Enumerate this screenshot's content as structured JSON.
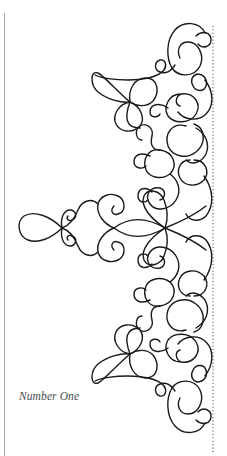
{
  "figure": {
    "caption": "Number One",
    "stroke_color": "#1a1a1a",
    "stroke_width": 1.4,
    "guide_color": "#333333",
    "page_edge_color": "#a8a8a8",
    "guide_line": {
      "x": 213,
      "y1": 26,
      "y2": 452,
      "dash": "1 2.4"
    },
    "motifs": [
      {
        "name": "top-right-scroll",
        "d": "M205 33 C200 22 184 20 175 30 C166 40 166 58 172 68 C178 77 194 78 200 66 C205 55 198 42 188 42 C180 42 176 50 180 58"
      },
      {
        "name": "top-small-curl",
        "d": "M196 36 C202 30 211 32 211 40 C211 46 203 50 198 44"
      },
      {
        "name": "top-connector",
        "d": "M175 65 C170 72 166 74 160 72 C154 70 154 62 160 60 C166 59 167 66 164 70 C158 78 140 80 128 80 C115 80 100 78 95 75"
      },
      {
        "name": "top-teardrop-left",
        "d": "M130 102 C118 92 104 76 98 73 C90 70 90 85 98 92 C108 100 122 103 130 102"
      },
      {
        "name": "top-clover-right-loop",
        "d": "M130 102 C128 90 134 78 146 78 C158 78 160 92 153 101 C146 108 136 106 130 102"
      },
      {
        "name": "top-clover-lower-loop",
        "d": "M130 102 C118 104 112 116 116 124 C120 132 132 134 140 126 C146 118 140 106 130 102 M130 102 C124 118 126 128 140 128"
      },
      {
        "name": "top-right-circle-1",
        "d": "M197 74 C204 74 208 80 206 86 C204 92 196 92 193 86 C190 80 192 76 197 74"
      },
      {
        "name": "top-right-circle-2",
        "d": "M181 94 C168 94 163 108 168 116 C174 124 190 124 196 114 C202 104 194 92 181 94 C176 96 174 104 180 106"
      },
      {
        "name": "top-right-curl",
        "d": "M168 108 C160 102 150 104 150 112 C150 118 158 118 160 114"
      },
      {
        "name": "top-right-tail",
        "d": "M205 80 C214 92 214 106 206 114 C198 122 184 120 178 112"
      },
      {
        "name": "upper-mid-scroll",
        "d": "M186 126 C172 122 164 134 168 146 C172 156 186 160 196 152 C206 144 206 128 194 124"
      },
      {
        "name": "upper-mid-curl",
        "d": "M196 128 C206 134 210 144 206 154 C202 162 192 166 186 160"
      },
      {
        "name": "upper-mid-circle-a",
        "d": "M160 150 C148 148 142 160 146 170 C150 178 162 180 170 174 C178 166 174 152 160 150"
      },
      {
        "name": "upper-mid-circle-b",
        "d": "M190 160 C180 160 176 170 180 178 C184 186 196 188 204 180 C210 172 206 160 194 160"
      },
      {
        "name": "upper-stem",
        "d": "M160 150 C152 150 150 144 152 136 C154 128 146 122 140 126 C134 130 136 140 142 140"
      },
      {
        "name": "upper-left-curl",
        "d": "M150 156 C142 152 134 154 134 162 C134 168 142 170 146 166"
      },
      {
        "name": "upper-swirl-to-center",
        "d": "M170 174 C178 180 182 190 176 200 C170 210 156 212 150 204 C144 196 150 186 160 188 C166 190 166 198 160 200"
      },
      {
        "name": "upper-right-scroll",
        "d": "M204 176 C214 190 214 206 206 216 C200 222 190 222 186 214"
      },
      {
        "name": "upper-curl-small",
        "d": "M152 192 C146 186 138 188 138 196 C138 202 144 204 148 200"
      },
      {
        "name": "center-knot-upper-petal",
        "d": "M165 228 C150 218 140 206 144 196 C148 188 160 190 164 200 C168 210 168 220 165 228"
      },
      {
        "name": "center-right-arc-up",
        "d": "M165 228 C180 222 196 214 206 206"
      },
      {
        "name": "center-right-arc-down",
        "d": "M165 228 C180 234 196 242 206 250"
      },
      {
        "name": "center-knot-lower-petal",
        "d": "M165 228 C150 238 140 250 144 260 C148 268 160 266 164 256 C168 246 168 236 165 228"
      },
      {
        "name": "center-stem",
        "d": "M165 228 C148 218 130 216 114 228 C130 240 148 238 165 228"
      },
      {
        "name": "center-heart-upper",
        "d": "M114 228 C104 224 96 214 98 204 C100 196 110 192 118 196 C126 200 126 212 118 214 C112 216 110 210 114 206"
      },
      {
        "name": "center-heart-lower",
        "d": "M114 228 C104 232 96 242 98 252 C100 260 110 264 118 260 C126 256 126 244 118 242 C112 240 110 246 114 250"
      },
      {
        "name": "center-s-upper",
        "d": "M98 204 C92 198 82 200 78 210 C74 220 68 226 62 228"
      },
      {
        "name": "center-s-lower",
        "d": "M98 252 C92 258 82 256 78 246 C74 236 68 230 62 228"
      },
      {
        "name": "center-small-loop-upper",
        "d": "M62 228 C60 218 64 210 70 210 C76 210 78 218 72 220 C68 222 66 218 68 216"
      },
      {
        "name": "center-small-loop-lower",
        "d": "M62 228 C60 238 64 246 70 246 C76 246 78 238 72 236 C68 234 66 238 68 240"
      },
      {
        "name": "center-left-teardrop",
        "d": "M62 228 C50 216 34 210 24 216 C16 222 18 236 28 240 C38 244 52 238 62 228"
      },
      {
        "name": "lower-swirl-from-center",
        "d": "M170 282 C178 276 182 266 176 256 C170 246 156 244 150 252 C144 260 150 270 160 268 C166 266 166 258 160 256"
      },
      {
        "name": "lower-curl-small",
        "d": "M152 264 C146 270 138 268 138 260 C138 254 144 252 148 256"
      },
      {
        "name": "lower-right-scroll",
        "d": "M204 280 C214 266 214 250 206 240 C200 234 190 234 186 242"
      },
      {
        "name": "lower-mid-circle-a",
        "d": "M160 306 C148 308 142 296 146 286 C150 278 162 276 170 282 C178 290 174 304 160 306"
      },
      {
        "name": "lower-mid-circle-b",
        "d": "M190 296 C180 296 176 286 180 278 C184 270 196 268 204 276 C210 284 206 296 194 296"
      },
      {
        "name": "lower-left-curl",
        "d": "M150 300 C142 304 134 302 134 294 C134 288 142 286 146 290"
      },
      {
        "name": "lower-stem",
        "d": "M160 306 C152 306 150 312 152 320 C154 328 146 334 140 330 C134 326 136 316 142 316"
      },
      {
        "name": "lower-mid-scroll",
        "d": "M186 330 C172 334 164 322 168 310 C172 300 186 296 196 304 C206 312 206 328 194 332"
      },
      {
        "name": "lower-mid-curl",
        "d": "M196 328 C206 322 210 312 206 302 C202 294 192 290 186 296"
      },
      {
        "name": "lower-right-tail",
        "d": "M205 376 C214 364 214 350 206 342 C198 334 184 336 178 344"
      },
      {
        "name": "lower-right-circle-2",
        "d": "M181 362 C168 362 163 348 168 340 C174 332 190 332 196 342 C202 352 194 364 181 362 C176 360 174 352 180 350"
      },
      {
        "name": "lower-right-curl",
        "d": "M168 348 C160 354 150 352 150 344 C150 338 158 338 160 342"
      },
      {
        "name": "lower-right-circle-1",
        "d": "M197 382 C204 382 208 376 206 370 C204 364 196 364 193 370 C190 376 192 380 197 382"
      },
      {
        "name": "bottom-teardrop-left",
        "d": "M130 354 C118 364 104 380 98 383 C90 386 90 371 98 364 C108 356 122 353 130 354"
      },
      {
        "name": "bottom-clover-right-loop",
        "d": "M130 354 C128 366 134 378 146 378 C158 378 160 364 153 355 C146 348 136 350 130 354"
      },
      {
        "name": "bottom-clover-upper-loop",
        "d": "M130 354 C118 352 112 340 116 332 C120 324 132 322 140 330 C146 338 140 350 130 354 M130 354 C124 338 126 328 140 328"
      },
      {
        "name": "bottom-connector",
        "d": "M175 391 C170 384 166 382 160 384 C154 386 154 394 160 396 C166 397 167 390 164 386 C158 378 140 376 128 376 C115 376 100 378 95 381"
      },
      {
        "name": "bottom-right-scroll",
        "d": "M205 423 C200 434 184 436 175 426 C166 416 166 398 172 388 C178 379 194 378 200 390 C205 401 198 414 188 414 C180 414 176 406 180 398"
      },
      {
        "name": "bottom-small-curl",
        "d": "M196 420 C202 426 211 424 211 416 C211 410 203 406 198 412"
      }
    ]
  }
}
